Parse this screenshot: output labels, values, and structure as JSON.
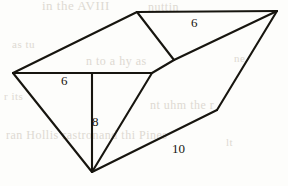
{
  "page": {
    "width": 288,
    "height": 186,
    "background_color": "#fdfdfb",
    "ink_color": "#17150f",
    "bleed_color": "#d9d4cb"
  },
  "figure": {
    "name": "oblique-prism-diagram",
    "stroke_color": "#17150f",
    "stroke_width": 2.1,
    "vertices": {
      "left": [
        13,
        73
      ],
      "top_left_peak": [
        137,
        12
      ],
      "top_right": [
        277,
        11
      ],
      "mid_junction": [
        174,
        60
      ],
      "front_right": [
        152,
        73
      ],
      "bottom_apex": [
        92,
        172
      ],
      "right_bend": [
        217,
        110
      ],
      "vertical_top": [
        92,
        73
      ]
    },
    "edges": [
      {
        "name": "left-to-top-left-peak",
        "from": [
          13,
          73
        ],
        "to": [
          137,
          12
        ]
      },
      {
        "name": "top-ridge",
        "from": [
          137,
          12
        ],
        "to": [
          277,
          11
        ]
      },
      {
        "name": "top-left-peak-to-mid-junction",
        "from": [
          137,
          12
        ],
        "to": [
          174,
          60
        ]
      },
      {
        "name": "mid-junction-to-top-right",
        "from": [
          174,
          60
        ],
        "to": [
          277,
          11
        ]
      },
      {
        "name": "mid-junction-to-front-right",
        "from": [
          174,
          60
        ],
        "to": [
          152,
          73
        ]
      },
      {
        "name": "front-horizontal-edge",
        "from": [
          13,
          73
        ],
        "to": [
          152,
          73
        ]
      },
      {
        "name": "left-to-bottom-apex",
        "from": [
          13,
          73
        ],
        "to": [
          92,
          172
        ]
      },
      {
        "name": "vertical-height-edge",
        "from": [
          92,
          73
        ],
        "to": [
          92,
          172
        ]
      },
      {
        "name": "front-right-to-bottom-apex",
        "from": [
          152,
          73
        ],
        "to": [
          92,
          172
        ]
      },
      {
        "name": "bottom-apex-to-right-bend",
        "from": [
          92,
          172
        ],
        "to": [
          217,
          110
        ]
      },
      {
        "name": "right-bend-to-top-right",
        "from": [
          217,
          110
        ],
        "to": [
          277,
          11
        ]
      }
    ],
    "labels": [
      {
        "name": "label-top-6",
        "text": "6",
        "x": 191,
        "y": 16
      },
      {
        "name": "label-left-6",
        "text": "6",
        "x": 61,
        "y": 74
      },
      {
        "name": "label-height-8",
        "text": "8",
        "x": 92,
        "y": 115
      },
      {
        "name": "label-bottom-10",
        "text": "10",
        "x": 172,
        "y": 142
      }
    ]
  },
  "bleed_through": [
    {
      "name": "bleed-row-1",
      "text": "in the  AVIII",
      "x": 42,
      "y": -2,
      "size": 13
    },
    {
      "name": "bleed-row-2",
      "text": "nuttin",
      "x": 148,
      "y": 0,
      "size": 12
    },
    {
      "name": "bleed-row-3",
      "text": "as tu",
      "x": 12,
      "y": 38,
      "size": 11
    },
    {
      "name": "bleed-row-4",
      "text": "n  to  a  hy  as",
      "x": 86,
      "y": 54,
      "size": 12
    },
    {
      "name": "bleed-row-5",
      "text": "ne",
      "x": 234,
      "y": 52,
      "size": 11
    },
    {
      "name": "bleed-row-6",
      "text": "r  its",
      "x": 4,
      "y": 90,
      "size": 11
    },
    {
      "name": "bleed-row-7",
      "text": "nt  uhm  the  r",
      "x": 150,
      "y": 98,
      "size": 12
    },
    {
      "name": "bleed-row-8",
      "text": "ran  Hollis  rastronand  thi  Pines",
      "x": 6,
      "y": 128,
      "size": 12
    },
    {
      "name": "bleed-row-9",
      "text": "lt",
      "x": 226,
      "y": 136,
      "size": 11
    }
  ]
}
